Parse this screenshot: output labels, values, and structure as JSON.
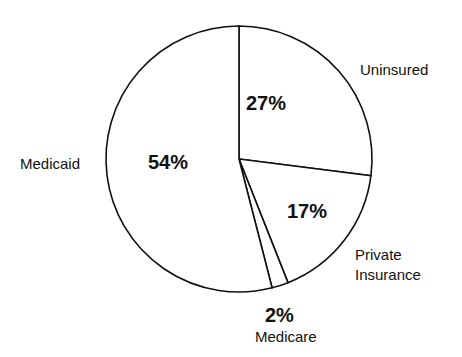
{
  "chart_data": {
    "type": "pie",
    "title": "",
    "categories": [
      "Uninsured",
      "Private Insurance",
      "Medicare",
      "Medicaid"
    ],
    "values": [
      27,
      17,
      2,
      54
    ],
    "value_labels": [
      "27%",
      "17%",
      "2%",
      "54%"
    ],
    "start_angle_deg": 0,
    "direction": "clockwise",
    "fill": "#ffffff",
    "stroke": "#111111",
    "legend": "none (labels placed outside slices)"
  },
  "labels": {
    "uninsured": "Uninsured",
    "private_line1": "Private",
    "private_line2": "Insurance",
    "medicare": "Medicare",
    "medicaid": "Medicaid"
  },
  "values": {
    "uninsured": "27%",
    "private": "17%",
    "medicare": "2%",
    "medicaid": "54%"
  }
}
